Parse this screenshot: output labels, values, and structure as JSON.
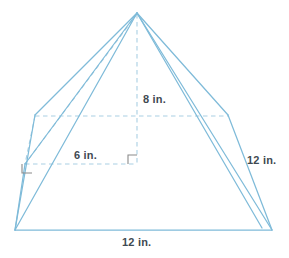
{
  "figure": {
    "name": "pyramid-net-diagram",
    "type": "geometric-solid",
    "solid": "pyramid",
    "colors": {
      "edge_solid": "#7fbbd9",
      "edge_dashed": "#a9cfe3",
      "label_text": "#3f4a52",
      "right_angle": "#7a7a7a",
      "background": "#ffffff"
    },
    "labels": {
      "height": "8 in.",
      "apothem": "6 in.",
      "slant_edge": "12 in.",
      "base_edge": "12 in."
    },
    "measurements": [
      {
        "name": "height",
        "value": 8,
        "unit": "in.",
        "text": "8 in."
      },
      {
        "name": "apothem",
        "value": 6,
        "unit": "in.",
        "text": "6 in."
      },
      {
        "name": "slant_edge",
        "value": 12,
        "unit": "in.",
        "text": "12 in."
      },
      {
        "name": "base_edge",
        "value": 12,
        "unit": "in.",
        "text": "12 in."
      }
    ],
    "markers": {
      "right_angle_base": "right-angle-marker",
      "right_angle_altitude": "right-angle-marker"
    },
    "vertices": {
      "apex": [
        137,
        13
      ],
      "base_left": [
        15,
        230
      ],
      "base_right": [
        272,
        230
      ],
      "shoulder_left": [
        35,
        115
      ],
      "shoulder_right": [
        228,
        115
      ],
      "hidden_back": [
        25,
        164
      ],
      "center": [
        137,
        164
      ]
    }
  }
}
